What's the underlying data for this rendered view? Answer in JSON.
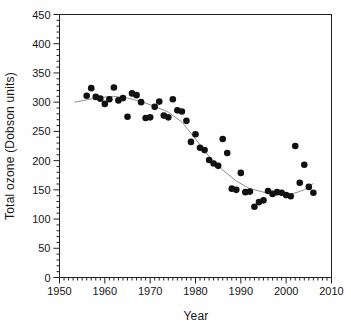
{
  "chart_data": {
    "type": "scatter",
    "title": "",
    "xlabel": "Year",
    "ylabel": "Total ozone (Dobson units)",
    "xlim": [
      1950,
      2010
    ],
    "ylim": [
      0,
      450
    ],
    "x_ticks": [
      1950,
      1960,
      1970,
      1980,
      1990,
      2000,
      2010
    ],
    "y_ticks": [
      0,
      50,
      100,
      150,
      200,
      250,
      300,
      350,
      400,
      450
    ],
    "x_minor_step": 1,
    "y_minor_step": 10,
    "grid": false,
    "legend": "none",
    "frame": "full-box",
    "marker": "filled-circle",
    "marker_color": "#111111",
    "axis_color": "#222222",
    "trend_color": "#8f8f8f",
    "series": [
      {
        "name": "october-mean-total-ozone",
        "x": [
          1956,
          1957,
          1958,
          1959,
          1960,
          1961,
          1962,
          1963,
          1964,
          1965,
          1966,
          1967,
          1968,
          1969,
          1970,
          1971,
          1972,
          1973,
          1974,
          1975,
          1976,
          1977,
          1978,
          1979,
          1980,
          1981,
          1982,
          1983,
          1984,
          1985,
          1986,
          1987,
          1988,
          1989,
          1990,
          1991,
          1992,
          1993,
          1994,
          1995,
          1996,
          1997,
          1998,
          1999,
          2000,
          2001,
          2002,
          2003,
          2004,
          2005,
          2006
        ],
        "y": [
          311,
          324,
          309,
          306,
          297,
          305,
          325,
          303,
          307,
          275,
          315,
          312,
          300,
          273,
          274,
          292,
          301,
          277,
          274,
          305,
          286,
          284,
          268,
          232,
          245,
          222,
          218,
          201,
          195,
          191,
          237,
          213,
          152,
          150,
          179,
          146,
          147,
          121,
          129,
          132,
          148,
          143,
          146,
          145,
          141,
          139,
          225,
          162,
          193,
          155,
          145
        ]
      }
    ],
    "trend": {
      "name": "smoothed-trend",
      "x": [
        1953.3,
        1956,
        1959,
        1962,
        1965,
        1968,
        1971,
        1974,
        1977,
        1980,
        1983,
        1986,
        1989,
        1992,
        1995,
        1998,
        2001,
        2004,
        2006
      ],
      "y": [
        300,
        304,
        308,
        310,
        307,
        301,
        293,
        283,
        266,
        237,
        207,
        184,
        165,
        152,
        146,
        142,
        142,
        150,
        161
      ]
    }
  }
}
